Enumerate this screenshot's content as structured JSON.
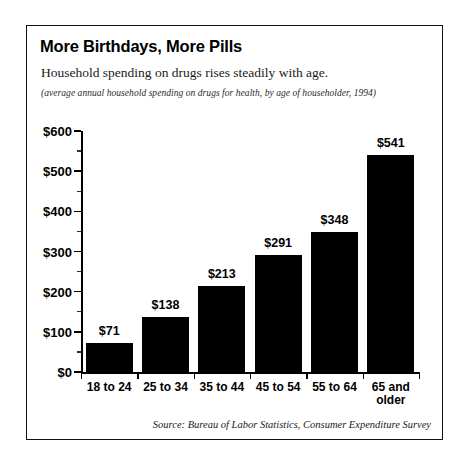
{
  "chart_data": {
    "type": "bar",
    "title": "More Birthdays, More Pills",
    "subtitle": "Household spending on drugs rises steadily with age.",
    "note": "(average annual household spending on drugs for health, by age of householder, 1994)",
    "source": "Source: Bureau of Labor Statistics, Consumer Expenditure Survey",
    "categories": [
      "18 to 24",
      "25 to 34",
      "35 to 44",
      "45 to 54",
      "55 to 64",
      "65 and older"
    ],
    "values": [
      71,
      138,
      213,
      291,
      348,
      541
    ],
    "value_labels": [
      "$71",
      "$138",
      "$213",
      "$291",
      "$348",
      "$541"
    ],
    "xlabel": "",
    "ylabel": "",
    "ylim": [
      0,
      600
    ],
    "ytick_values": [
      0,
      100,
      200,
      300,
      400,
      500,
      600
    ],
    "ytick_labels": [
      "$0",
      "$100",
      "$200",
      "$300",
      "$400",
      "$500",
      "$600"
    ],
    "yminor_tick_values": [
      50,
      150,
      250,
      350,
      450,
      550
    ],
    "grid": false,
    "legend": false,
    "bar_color": "#000000",
    "background_color": "#ffffff",
    "border_color": "#111111"
  }
}
